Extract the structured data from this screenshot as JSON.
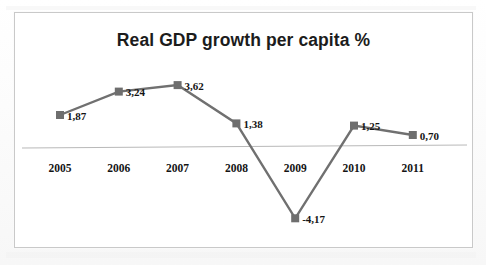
{
  "chart_data": {
    "type": "line",
    "title": "Real GDP growth per capita %",
    "xlabel": "",
    "ylabel": "",
    "categories": [
      "2005",
      "2006",
      "2007",
      "2008",
      "2009",
      "2010",
      "2011"
    ],
    "values": [
      1.87,
      3.24,
      3.62,
      1.38,
      -4.17,
      1.25,
      0.7
    ],
    "value_labels": [
      "1,87",
      "3,24",
      "3,62",
      "1,38",
      "-4,17",
      "1,25",
      "0,70"
    ],
    "decimal_separator": ",",
    "ylim": [
      -4.6,
      4.2
    ],
    "grid": false,
    "legend": null,
    "zero_axis_visible": true,
    "marker": "square",
    "series_color": "#6e6e6e",
    "axis_color": "#b9b9b9",
    "title_color": "#1c1c1c",
    "label_color": "#141414",
    "background_color": "#ffffff",
    "border_color": "#c9c9c9"
  },
  "figure": {
    "caption": "",
    "frame_label": "chart-frame"
  }
}
